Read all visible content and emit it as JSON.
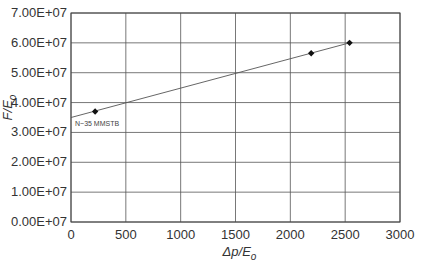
{
  "chart_data": {
    "type": "scatter",
    "title": "",
    "xlabel": "Δp/E_o",
    "xlabel_parts": {
      "main": "Δp/E",
      "sub": "o"
    },
    "ylabel": "F/E_o",
    "ylabel_parts": {
      "main": "F/E",
      "sub": "o"
    },
    "xlim": [
      0,
      3000
    ],
    "ylim": [
      0,
      70000000
    ],
    "grid": true,
    "x_ticks": [
      0,
      500,
      1000,
      1500,
      2000,
      2500,
      3000
    ],
    "x_tick_labels": [
      "0",
      "500",
      "1000",
      "1500",
      "2000",
      "2500",
      "3000"
    ],
    "y_ticks": [
      0,
      10000000,
      20000000,
      30000000,
      40000000,
      50000000,
      60000000,
      70000000
    ],
    "y_tick_labels": [
      "0.00E+07",
      "1.00E+07",
      "2.00E+07",
      "3.00E+07",
      "4.00E+07",
      "5.00E+07",
      "6.00E+07",
      "7.00E+07"
    ],
    "series": [
      {
        "name": "data",
        "marker": "diamond",
        "x": [
          220,
          2190,
          2540
        ],
        "y": [
          37000000,
          56500000,
          60000000
        ]
      }
    ],
    "fit_line": {
      "x": [
        0,
        2540
      ],
      "y": [
        35000000,
        60000000
      ],
      "intercept_label": "N ~ 35 MMSTB"
    },
    "annotations": [
      {
        "text": "N~35 MMSTB",
        "x": 0,
        "y": 32000000
      }
    ],
    "colors": {
      "line": "#555555",
      "grid": "#555555",
      "marker": "#111111",
      "text": "#333333"
    }
  }
}
